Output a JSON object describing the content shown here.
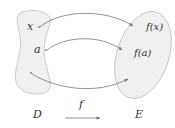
{
  "diagram": {
    "type": "function-mapping",
    "domain_set": {
      "label": "D",
      "fill": "#f0f0f0",
      "stroke": "#bfbfbf"
    },
    "codomain_set": {
      "label": "E",
      "fill": "#f0f0f0",
      "stroke": "#bfbfbf"
    },
    "function_label": "f",
    "arrow_color": "#777777",
    "mappings": [
      {
        "from": "x",
        "to": "f(x)"
      },
      {
        "from": "a",
        "to": "f(a)"
      },
      {
        "from": "",
        "to": ""
      }
    ]
  }
}
